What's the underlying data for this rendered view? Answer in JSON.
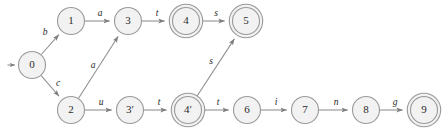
{
  "diagram": {
    "type": "finite-state-automaton",
    "title": "",
    "canvas": {
      "width": 447,
      "height": 133
    },
    "style": {
      "node_fill": "#f2f2f2",
      "node_stroke": "#9a9a9a",
      "edge_stroke": "#8d8d8d",
      "label_color": "#1f1f1f",
      "background": "#ffffff"
    },
    "start_marker": {
      "target": "0",
      "name": "start-arrow"
    },
    "nodes": [
      {
        "id": "0",
        "label": "0",
        "x": 32,
        "y": 65,
        "r": 13.5,
        "accepting": false
      },
      {
        "id": "1",
        "label": "1",
        "x": 71,
        "y": 21,
        "r": 13.5,
        "accepting": false
      },
      {
        "id": "2",
        "label": "2",
        "x": 71,
        "y": 110,
        "r": 13.5,
        "accepting": false
      },
      {
        "id": "3",
        "label": "3",
        "x": 128,
        "y": 21,
        "r": 13.5,
        "accepting": false
      },
      {
        "id": "4",
        "label": "4",
        "x": 186,
        "y": 21,
        "r": 13.5,
        "accepting": true
      },
      {
        "id": "5",
        "label": "5",
        "x": 246,
        "y": 21,
        "r": 13.5,
        "accepting": true
      },
      {
        "id": "3p",
        "label": "3′",
        "x": 130,
        "y": 110,
        "r": 13.5,
        "accepting": false
      },
      {
        "id": "4p",
        "label": "4′",
        "x": 188,
        "y": 110,
        "r": 13.5,
        "accepting": true
      },
      {
        "id": "6",
        "label": "6",
        "x": 247,
        "y": 110,
        "r": 13.5,
        "accepting": false
      },
      {
        "id": "7",
        "label": "7",
        "x": 305,
        "y": 110,
        "r": 13.5,
        "accepting": false
      },
      {
        "id": "8",
        "label": "8",
        "x": 366,
        "y": 110,
        "r": 13.5,
        "accepting": false
      },
      {
        "id": "9",
        "label": "9",
        "x": 424,
        "y": 110,
        "r": 13.5,
        "accepting": true
      }
    ],
    "edges": [
      {
        "from": "0",
        "to": "1",
        "label": "b",
        "lx": 45,
        "ly": 33
      },
      {
        "from": "0",
        "to": "2",
        "label": "c",
        "lx": 58,
        "ly": 84
      },
      {
        "from": "1",
        "to": "3",
        "label": "a",
        "lx": 100,
        "ly": 14
      },
      {
        "from": "3",
        "to": "4",
        "label": "t",
        "lx": 157,
        "ly": 14
      },
      {
        "from": "4",
        "to": "5",
        "label": "s",
        "lx": 216,
        "ly": 14
      },
      {
        "from": "2",
        "to": "3",
        "label": "a",
        "lx": 93,
        "ly": 66
      },
      {
        "from": "2",
        "to": "3p",
        "label": "u",
        "lx": 101,
        "ly": 103
      },
      {
        "from": "3p",
        "to": "4p",
        "label": "t",
        "lx": 159,
        "ly": 103
      },
      {
        "from": "4p",
        "to": "5",
        "label": "s",
        "lx": 211,
        "ly": 62
      },
      {
        "from": "4p",
        "to": "6",
        "label": "t",
        "lx": 218,
        "ly": 103
      },
      {
        "from": "6",
        "to": "7",
        "label": "i",
        "lx": 276,
        "ly": 103
      },
      {
        "from": "7",
        "to": "8",
        "label": "n",
        "lx": 336,
        "ly": 103
      },
      {
        "from": "8",
        "to": "9",
        "label": "g",
        "lx": 395,
        "ly": 103
      }
    ]
  }
}
